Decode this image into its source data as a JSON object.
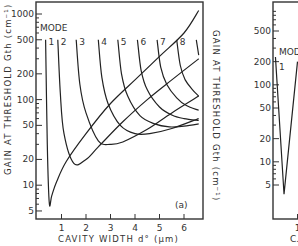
{
  "chart_data": [
    {
      "type": "line",
      "panel": "a",
      "panel_label": "(a)",
      "title": "",
      "xlabel": "CAVITY WIDTH d° (μm)",
      "ylabel": "GAIN AT THRESHOLD Gth (cm⁻¹)",
      "yscale": "log",
      "xlim": [
        0,
        6.7
      ],
      "ylim": [
        4,
        1300
      ],
      "x_ticks": [
        1,
        2,
        3,
        4,
        5,
        6
      ],
      "y_ticks": [
        5,
        10,
        20,
        50,
        100,
        200,
        500,
        1000
      ],
      "grid": false,
      "legend_title": "MODE",
      "mode_labels": [
        "1",
        "2",
        "3",
        "4",
        "5",
        "6",
        "7",
        "8",
        "9"
      ],
      "series": [
        {
          "name": "mode 1",
          "x": [
            0.35,
            0.42,
            0.5,
            0.6,
            0.8,
            1.2,
            2.0,
            3.0,
            4.0,
            5.0,
            6.0,
            6.6
          ],
          "y": [
            500,
            30,
            6.2,
            7.5,
            11,
            19,
            40,
            90,
            170,
            320,
            600,
            1100
          ]
        },
        {
          "name": "mode 2",
          "x": [
            0.85,
            0.95,
            1.1,
            1.5,
            2.0,
            2.5,
            3.5,
            4.5,
            5.5,
            6.6
          ],
          "y": [
            500,
            120,
            40,
            18,
            20,
            28,
            55,
            100,
            170,
            300
          ]
        },
        {
          "name": "mode 3",
          "x": [
            1.6,
            1.75,
            2.0,
            2.5,
            3.0,
            3.5,
            4.5,
            5.5,
            6.6
          ],
          "y": [
            500,
            150,
            70,
            33,
            30,
            32,
            45,
            70,
            110
          ]
        },
        {
          "name": "mode 4",
          "x": [
            2.5,
            2.65,
            2.9,
            3.4,
            4.0,
            4.6,
            5.5,
            6.6
          ],
          "y": [
            500,
            180,
            90,
            50,
            40,
            40,
            46,
            60
          ]
        },
        {
          "name": "mode 5",
          "x": [
            3.3,
            3.45,
            3.7,
            4.2,
            4.8,
            5.4,
            6.0,
            6.6
          ],
          "y": [
            500,
            200,
            110,
            65,
            52,
            48,
            49,
            52
          ]
        },
        {
          "name": "mode 6",
          "x": [
            4.1,
            4.25,
            4.5,
            5.0,
            5.5,
            6.0,
            6.6
          ],
          "y": [
            500,
            220,
            130,
            82,
            66,
            60,
            57
          ]
        },
        {
          "name": "mode 7",
          "x": [
            4.9,
            5.05,
            5.3,
            5.7,
            6.1,
            6.6
          ],
          "y": [
            500,
            240,
            150,
            105,
            85,
            75
          ]
        },
        {
          "name": "mode 8",
          "x": [
            5.7,
            5.85,
            6.05,
            6.35,
            6.6
          ],
          "y": [
            500,
            250,
            170,
            130,
            110
          ]
        },
        {
          "name": "mode 9",
          "x": [
            6.5,
            6.6
          ],
          "y": [
            500,
            330
          ]
        }
      ],
      "annotations": [
        "MODE",
        "(a)"
      ]
    },
    {
      "type": "line",
      "panel": "b (partially visible)",
      "ylabel": "GAIN AT THRESHOLD Gth (cm⁻¹)",
      "xlabel": "C...",
      "yscale": "log",
      "y_ticks": [
        5,
        10,
        20,
        50,
        100,
        200,
        500
      ],
      "x_ticks": [
        1
      ],
      "legend_title": "MOD...",
      "mode_labels": [
        "1"
      ],
      "series": [
        {
          "name": "mode 1",
          "x": [
            0.1,
            0.45,
            1.0
          ],
          "y": [
            230,
            3.8,
            200
          ]
        }
      ]
    }
  ]
}
